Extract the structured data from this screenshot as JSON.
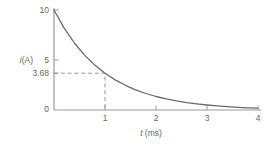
{
  "chart_data": {
    "type": "line",
    "title": "",
    "xlabel": "t (ms)",
    "ylabel": "i (A)",
    "xlabel_var": "t",
    "xlabel_unit": " (ms)",
    "ylabel_var": "i",
    "ylabel_unit": "(A)",
    "xlim": [
      0,
      4
    ],
    "ylim": [
      0,
      10
    ],
    "grid": false,
    "legend": null,
    "x_ticks": [
      {
        "value": 1,
        "label": "1"
      },
      {
        "value": 2,
        "label": "2"
      },
      {
        "value": 3,
        "label": "3"
      },
      {
        "value": 4,
        "label": "4"
      }
    ],
    "y_ticks": [
      {
        "value": 0,
        "label": "0",
        "tick": false
      },
      {
        "value": 3.68,
        "label": "3.68",
        "tick": true
      },
      {
        "value": 5,
        "label": "5",
        "tick": true
      },
      {
        "value": 10,
        "label": "10",
        "tick": true
      }
    ],
    "series": [
      {
        "name": "i(t) decay curve",
        "x": [
          0,
          0.2,
          0.4,
          0.6,
          0.8,
          1.0,
          1.2,
          1.4,
          1.6,
          1.8,
          2.0,
          2.2,
          2.4,
          2.6,
          2.8,
          3.0,
          3.2,
          3.4,
          3.6,
          3.8,
          4.0
        ],
        "values": [
          10,
          8.19,
          6.7,
          5.49,
          4.49,
          3.68,
          3.01,
          2.47,
          2.02,
          1.65,
          1.35,
          1.11,
          0.91,
          0.74,
          0.61,
          0.5,
          0.41,
          0.33,
          0.27,
          0.22,
          0.18
        ]
      }
    ],
    "annotations": [
      {
        "type": "dashed-guides",
        "t": 1,
        "i": 3.68
      }
    ],
    "colors": {
      "curve": "#6a6a6a",
      "axis": "#9a9a9a",
      "dashed": "#999999",
      "text": "#666666"
    }
  }
}
